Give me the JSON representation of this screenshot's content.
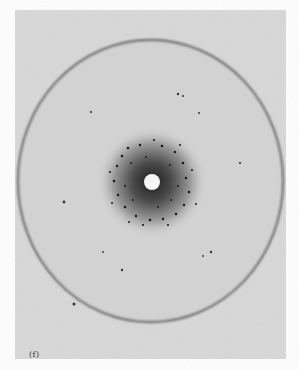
{
  "figure": {
    "panel_label": "(f)",
    "type": "diffraction-pattern-photograph",
    "background_color": "#d6d6d6",
    "ring": {
      "cx": 150.5,
      "cy": 181,
      "rx": 132.5,
      "ry": 141,
      "color": "#6a6a6a"
    },
    "beam_stop": {
      "cx": 152,
      "cy": 182,
      "r": 8,
      "color": "#f6f6f6"
    },
    "halo": {
      "cx": 152,
      "cy": 182,
      "r": 48,
      "color": "#3a3a3a"
    },
    "scattered_spots": [
      {
        "x": 64,
        "y": 202
      },
      {
        "x": 74,
        "y": 304
      },
      {
        "x": 178,
        "y": 94
      },
      {
        "x": 183,
        "y": 96
      },
      {
        "x": 91,
        "y": 112
      },
      {
        "x": 199,
        "y": 113
      },
      {
        "x": 211,
        "y": 252
      },
      {
        "x": 122,
        "y": 270
      },
      {
        "x": 240,
        "y": 163
      },
      {
        "x": 203,
        "y": 256
      },
      {
        "x": 103,
        "y": 252
      }
    ]
  }
}
